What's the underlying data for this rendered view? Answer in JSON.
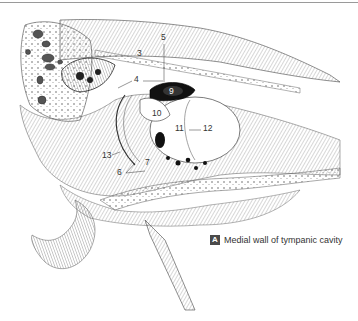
{
  "figure": {
    "caption_letter": "A",
    "caption_text": "Medial wall of tympanic cavity"
  },
  "labels": [
    {
      "id": "3",
      "text": "3",
      "x": 137,
      "y": 52
    },
    {
      "id": "4",
      "text": "4",
      "x": 136,
      "y": 78
    },
    {
      "id": "5",
      "text": "5",
      "x": 162,
      "y": 35
    },
    {
      "id": "6",
      "text": "6",
      "x": 118,
      "y": 170
    },
    {
      "id": "7",
      "text": "7",
      "x": 146,
      "y": 160
    },
    {
      "id": "9",
      "text": "9",
      "x": 170,
      "y": 91
    },
    {
      "id": "10",
      "text": "10",
      "x": 154,
      "y": 111
    },
    {
      "id": "11",
      "text": "11",
      "x": 176,
      "y": 127
    },
    {
      "id": "12",
      "text": "12",
      "x": 203,
      "y": 127
    },
    {
      "id": "13",
      "text": "13",
      "x": 104,
      "y": 153
    }
  ]
}
